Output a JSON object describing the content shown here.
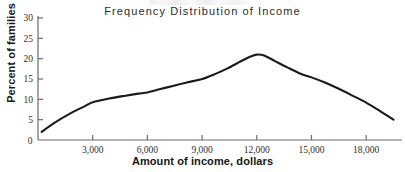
{
  "chart_data": {
    "type": "line",
    "title": "Frequency Distribution of Income",
    "xlabel": "Amount of income, dollars",
    "ylabel": "Percent of families",
    "xlim": [
      0,
      19800
    ],
    "ylim": [
      0,
      30
    ],
    "grid": false,
    "legend": null,
    "xticks": [
      0,
      3000,
      6000,
      9000,
      12000,
      15000,
      18000
    ],
    "xticklabels": [
      "0",
      "3,000",
      "6,000",
      "9,000",
      "12,000",
      "15,000",
      "18,000"
    ],
    "yticks": [
      0,
      5,
      10,
      15,
      20,
      25,
      30
    ],
    "yticklabels": [
      "0",
      "5",
      "10",
      "15",
      "20",
      "25",
      "30"
    ],
    "series": [
      {
        "name": "Percent of families",
        "x": [
          200,
          900,
          1800,
          2600,
          3000,
          3900,
          4800,
          5500,
          6000,
          6600,
          7400,
          8200,
          9000,
          9700,
          10400,
          11100,
          11700,
          12000,
          12400,
          13000,
          13700,
          14400,
          15000,
          15700,
          16500,
          17300,
          18000,
          18800,
          19500
        ],
        "values": [
          2.0,
          4.2,
          6.6,
          8.4,
          9.3,
          10.2,
          10.9,
          11.4,
          11.7,
          12.4,
          13.3,
          14.2,
          15.0,
          16.2,
          17.6,
          19.3,
          20.6,
          21.0,
          20.8,
          19.4,
          17.8,
          16.3,
          15.4,
          14.2,
          12.6,
          10.8,
          9.2,
          7.0,
          5.0
        ]
      }
    ],
    "peak": {
      "x": 12000,
      "y": 21.0
    },
    "annotations": []
  },
  "figure": {
    "title": "Frequency Distribution of Income",
    "x_axis_label": "Amount of income, dollars",
    "y_axis_label": "Percent of families",
    "line_color": "#1a1a1a",
    "axis_color": "#6b6b6b",
    "text_color": "#2e2e2e",
    "background": "#ffffff"
  }
}
